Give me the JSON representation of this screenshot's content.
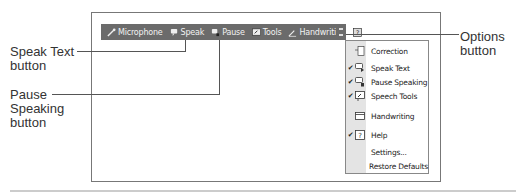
{
  "toolbar": {
    "items": [
      {
        "label": "Microphone",
        "icon": "microphone-icon"
      },
      {
        "label": "Speak",
        "icon": "speak-icon"
      },
      {
        "label": "Pause",
        "icon": "pause-speaking-icon"
      },
      {
        "label": "Tools",
        "icon": "tools-icon"
      },
      {
        "label": "Handwriting",
        "icon": "handwriting-icon"
      },
      {
        "label": "",
        "icon": "help-icon"
      }
    ],
    "options_icon": "options-icon",
    "background": "#6b6b6b"
  },
  "menu": {
    "items": [
      {
        "label": "Correction",
        "checked": false,
        "icon": "correction-icon"
      },
      {
        "label": "Speak Text",
        "checked": true,
        "icon": "speak-text-icon"
      },
      {
        "label": "Pause Speaking",
        "checked": true,
        "icon": "pause-speaking-icon"
      },
      {
        "label": "Speech Tools",
        "checked": true,
        "icon": "speech-tools-icon"
      },
      {
        "label": "Handwriting",
        "checked": false,
        "icon": "handwriting-icon"
      },
      {
        "label": "Help",
        "checked": true,
        "icon": "help-icon"
      },
      {
        "label": "Settings...",
        "checked": false,
        "icon": ""
      },
      {
        "label": "Restore Defaults",
        "checked": false,
        "icon": ""
      }
    ],
    "check_glyph": "✔"
  },
  "callouts": {
    "speak_text": [
      "Speak Text",
      "button"
    ],
    "pause_speaking": [
      "Pause",
      "Speaking",
      "button"
    ],
    "options": [
      "Options",
      "button"
    ]
  }
}
